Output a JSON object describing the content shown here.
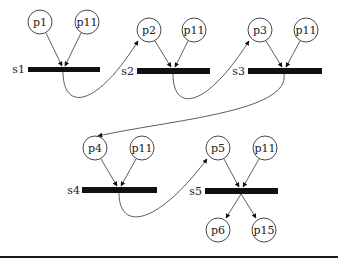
{
  "diagram": {
    "type": "petri-net",
    "places": [
      {
        "id": "p1",
        "label": "p1",
        "cx": 40,
        "cy": 22
      },
      {
        "id": "p11a",
        "label": "p11",
        "cx": 87,
        "cy": 22
      },
      {
        "id": "p2",
        "label": "p2",
        "cx": 149,
        "cy": 30
      },
      {
        "id": "p11b",
        "label": "p11",
        "cx": 194,
        "cy": 30
      },
      {
        "id": "p3",
        "label": "p3",
        "cx": 260,
        "cy": 30
      },
      {
        "id": "p11c",
        "label": "p11",
        "cx": 306,
        "cy": 30
      },
      {
        "id": "p4",
        "label": "p4",
        "cx": 95,
        "cy": 148
      },
      {
        "id": "p11d",
        "label": "p11",
        "cx": 142,
        "cy": 148
      },
      {
        "id": "p5",
        "label": "p5",
        "cx": 218,
        "cy": 148
      },
      {
        "id": "p11e",
        "label": "p11",
        "cx": 265,
        "cy": 148
      },
      {
        "id": "p6",
        "label": "p6",
        "cx": 218,
        "cy": 230
      },
      {
        "id": "p15",
        "label": "p15",
        "cx": 264,
        "cy": 230
      }
    ],
    "transitions": [
      {
        "id": "s1",
        "label": "s1"
      },
      {
        "id": "s2",
        "label": "s2"
      },
      {
        "id": "s3",
        "label": "s3"
      },
      {
        "id": "s4",
        "label": "s4"
      },
      {
        "id": "s5",
        "label": "s5"
      }
    ],
    "arcs": [
      {
        "from": "p1",
        "to": "s1"
      },
      {
        "from": "p11",
        "to": "s1"
      },
      {
        "from": "s1",
        "to": "p2"
      },
      {
        "from": "p2",
        "to": "s2"
      },
      {
        "from": "p11",
        "to": "s2"
      },
      {
        "from": "s2",
        "to": "p3"
      },
      {
        "from": "p3",
        "to": "s3"
      },
      {
        "from": "p11",
        "to": "s3"
      },
      {
        "from": "s3",
        "to": "p4"
      },
      {
        "from": "p4",
        "to": "s4"
      },
      {
        "from": "p11",
        "to": "s4"
      },
      {
        "from": "s4",
        "to": "p5"
      },
      {
        "from": "p5",
        "to": "s5"
      },
      {
        "from": "p11",
        "to": "s5"
      },
      {
        "from": "s5",
        "to": "p6"
      },
      {
        "from": "s5",
        "to": "p15"
      }
    ]
  },
  "colors": {
    "stroke": "#333333",
    "bar": "#111111",
    "background": "#ffffff"
  }
}
